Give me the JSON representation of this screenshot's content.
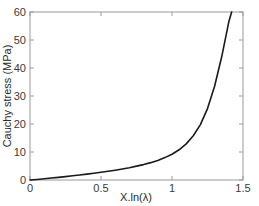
{
  "chart_data": {
    "type": "line",
    "title": "",
    "xlabel": "X.ln(λ)",
    "ylabel": "Cauchy stress (MPa)",
    "xlim": [
      0,
      1.5
    ],
    "ylim": [
      0,
      60
    ],
    "grid": false,
    "legend": null,
    "xticks": [
      "0",
      "0.5",
      "1",
      "1.5"
    ],
    "xtick_values": [
      0,
      0.5,
      1,
      1.5
    ],
    "yticks": [
      "0",
      "10",
      "20",
      "30",
      "40",
      "50",
      "60"
    ],
    "ytick_values": [
      0,
      10,
      20,
      30,
      40,
      50,
      60
    ],
    "series": [
      {
        "name": "Cauchy stress",
        "color": "#1a1a1a",
        "linewidth": 1.6,
        "x": [
          0,
          0.05,
          0.1,
          0.15,
          0.2,
          0.25,
          0.3,
          0.35,
          0.4,
          0.45,
          0.5,
          0.55,
          0.6,
          0.65,
          0.7,
          0.75,
          0.8,
          0.85,
          0.9,
          0.95,
          1.0,
          1.05,
          1.1,
          1.15,
          1.2,
          1.25,
          1.3,
          1.35,
          1.4,
          1.42
        ],
        "y": [
          0,
          0.2,
          0.45,
          0.7,
          0.95,
          1.2,
          1.5,
          1.8,
          2.1,
          2.4,
          2.75,
          3.1,
          3.5,
          3.95,
          4.4,
          4.95,
          5.5,
          6.2,
          7.0,
          8.0,
          9.2,
          10.8,
          12.9,
          15.8,
          19.8,
          25.5,
          33.5,
          44.0,
          56.5,
          60.0
        ]
      }
    ]
  },
  "axes": {
    "x_axis_label": "X.ln(λ)",
    "y_axis_label": "Cauchy stress (MPa)"
  },
  "colors": {
    "curve": "#1a1a1a",
    "axis": "#9a9a9a",
    "tick_text": "#3a3a3a",
    "background": "#ffffff"
  }
}
